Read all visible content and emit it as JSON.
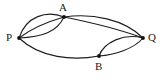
{
  "figure": {
    "kind": "multigraph-diagram",
    "background_color": "#ffffff",
    "stroke_color": "#1c1c1c",
    "vertex_color": "#111111",
    "width": 163,
    "height": 80
  },
  "vertices": [
    {
      "id": "A",
      "label": "A",
      "x": 64,
      "y": 17
    },
    {
      "id": "P",
      "label": "P",
      "x": 19,
      "y": 38
    },
    {
      "id": "Q",
      "label": "Q",
      "x": 143,
      "y": 38
    },
    {
      "id": "B",
      "label": "B",
      "x": 99,
      "y": 56
    }
  ],
  "edges": [
    {
      "id": "PA-1",
      "from": "P",
      "to": "A",
      "multiplicity_index": 1
    },
    {
      "id": "PA-2",
      "from": "P",
      "to": "A",
      "multiplicity_index": 2
    },
    {
      "id": "PA-3",
      "from": "P",
      "to": "A",
      "multiplicity_index": 3
    },
    {
      "id": "AQ-1",
      "from": "A",
      "to": "Q",
      "multiplicity_index": 1
    },
    {
      "id": "AQ-2",
      "from": "A",
      "to": "Q",
      "multiplicity_index": 2
    },
    {
      "id": "PB-1",
      "from": "P",
      "to": "B",
      "multiplicity_index": 1
    },
    {
      "id": "BQ-1",
      "from": "B",
      "to": "Q",
      "multiplicity_index": 1
    },
    {
      "id": "BQ-2",
      "from": "B",
      "to": "Q",
      "multiplicity_index": 2
    }
  ],
  "edge_geometry": {
    "PA-1": "M 19 38 C 26 16, 47 10, 64 17",
    "PA-2": "M 19 38 C 32 28, 50 21, 64 17",
    "PA-3": "M 19 38 C 42 37, 57 32, 64 17",
    "AQ-1": "M 64 17 C 92 13, 124 19, 143 38",
    "AQ-2": "M 64 17 C 94 23, 124 31, 143 38",
    "PB-1": "M 19 38 C 40 58, 73 61, 99 56",
    "BQ-1": "M 99 56 C 114 55, 134 49, 143 38",
    "BQ-2": "M 99 56 C 104 42, 124 33, 143 38"
  }
}
